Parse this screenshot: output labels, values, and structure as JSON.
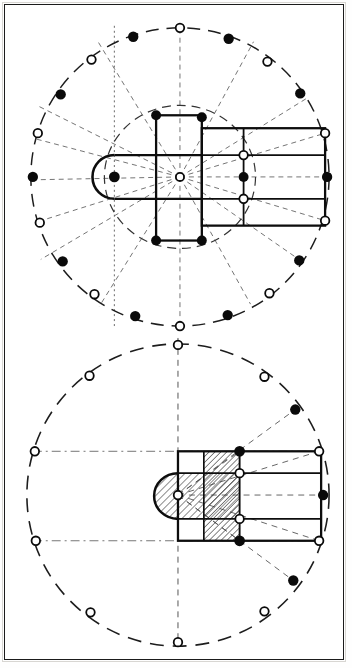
{
  "document": {
    "title": "Geometric analysis of a cruciform church plan",
    "kind": "architectural-diagram",
    "panel_count": 2,
    "background_color": "#ffffff",
    "ink_color": "#111111",
    "frame_color": "#1b1b1b",
    "hatch_color": "#2a2a2a",
    "construction_color": "#555555"
  },
  "panels": [
    {
      "id": "upper",
      "name": "upper-plan-diagram",
      "caption": "",
      "center": {
        "x": 180,
        "y": 178
      },
      "outer_circle": {
        "cx": 180,
        "cy": 178,
        "r": 148,
        "style": "dashed"
      },
      "inner_circle": {
        "cx": 180,
        "cy": 178,
        "r": 72,
        "style": "dashed"
      },
      "plan": {
        "style": "outline",
        "shaded": false,
        "apse_center": {
          "x": 118,
          "y": 178
        },
        "apse_radius": 22,
        "nave_left": 160,
        "nave_right": 310,
        "nave_top": 128,
        "nave_bottom": 222,
        "transept_left": 160,
        "transept_right": 210,
        "transept_top": 125,
        "transept_bottom": 243
      },
      "markers_filled": 12,
      "markers_open": 10,
      "radial_lines": 14
    },
    {
      "id": "lower",
      "name": "lower-plan-diagram",
      "caption": "",
      "center": {
        "x": 178,
        "y": 492
      },
      "outer_circle": {
        "cx": 178,
        "cy": 492,
        "r": 152,
        "style": "dashed"
      },
      "plan": {
        "style": "hatched",
        "shaded": true,
        "apse_center": {
          "x": 178,
          "y": 492
        },
        "apse_radius": 24,
        "nave_left": 178,
        "nave_right": 318,
        "nave_top": 446,
        "nave_bottom": 538
      },
      "markers_filled": 4,
      "markers_open": 12,
      "radial_lines": 6,
      "hatch": {
        "angle_deg": 45,
        "spacing_px": 4
      }
    }
  ],
  "legend": {
    "filled_marker": "filled-node",
    "open_marker": "ring-node",
    "dashed_circle": "construction-circle",
    "solid_line": "wall-line",
    "hatched_area": "shaded-bay"
  }
}
